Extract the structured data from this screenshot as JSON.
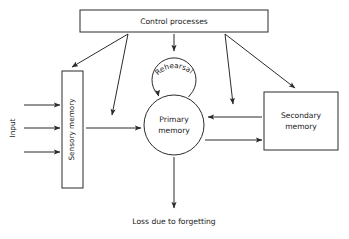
{
  "diagram": {
    "type": "flowchart",
    "background_color": "#ffffff",
    "stroke_color": "#2b2b2b",
    "text_color": "#1a1a1a",
    "nodes": {
      "control_processes": {
        "label": "Control processes",
        "shape": "rectangle",
        "x": 80,
        "y": 10,
        "width": 188,
        "height": 22
      },
      "sensory_memory": {
        "label": "Sensory memory",
        "shape": "rectangle-vertical",
        "orientation": "vertical-text",
        "x": 62,
        "y": 71,
        "width": 21,
        "height": 117
      },
      "primary_memory": {
        "label_line1": "Primary",
        "label_line2": "memory",
        "shape": "circle",
        "cx": 174,
        "cy": 125,
        "r": 30
      },
      "rehearsal_loop": {
        "label": "Rehearsal",
        "shape": "circle-arc",
        "cx": 174,
        "cy": 79,
        "r": 22
      },
      "secondary_memory": {
        "label_line1": "Secondary",
        "label_line2": "memory",
        "shape": "rectangle",
        "x": 264,
        "y": 92,
        "width": 74,
        "height": 58
      }
    },
    "labels": {
      "input": "Input",
      "loss": "Loss due to forgetting"
    },
    "edges": [
      {
        "name": "input-arrow-1",
        "from": "input",
        "to": "sensory_memory"
      },
      {
        "name": "input-arrow-2",
        "from": "input",
        "to": "sensory_memory"
      },
      {
        "name": "input-arrow-3",
        "from": "input",
        "to": "sensory_memory"
      },
      {
        "name": "sensory-to-primary",
        "from": "sensory_memory",
        "to": "primary_memory"
      },
      {
        "name": "control-to-sensory",
        "from": "control_processes",
        "to": "sensory_memory"
      },
      {
        "name": "control-to-transfer",
        "from": "control_processes",
        "to": "sensory_memory_transfer"
      },
      {
        "name": "control-to-rehearsal",
        "from": "control_processes",
        "to": "rehearsal_loop"
      },
      {
        "name": "control-to-retrieval",
        "from": "control_processes",
        "to": "primary_memory"
      },
      {
        "name": "control-to-secondary",
        "from": "control_processes",
        "to": "secondary_memory"
      },
      {
        "name": "secondary-to-primary",
        "from": "secondary_memory",
        "to": "primary_memory"
      },
      {
        "name": "primary-to-secondary",
        "from": "primary_memory",
        "to": "secondary_memory"
      },
      {
        "name": "primary-to-loss",
        "from": "primary_memory",
        "to": "loss"
      },
      {
        "name": "rehearsal-self-loop",
        "from": "primary_memory",
        "to": "primary_memory"
      }
    ]
  }
}
